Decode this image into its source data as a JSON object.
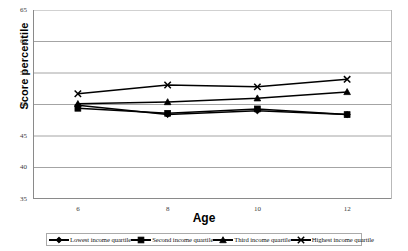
{
  "top_sliver_text": "",
  "axis": {
    "ylabel": "Score percentile",
    "xlabel": "Age",
    "yticks": [
      "65",
      "60",
      "55",
      "50",
      "45",
      "40",
      "35"
    ],
    "xticks": [
      "6",
      "8",
      "10",
      "12"
    ]
  },
  "legend": {
    "items": [
      {
        "label": "Lowest income quartile",
        "marker": "diamond-marker",
        "color": "#000000"
      },
      {
        "label": "Second income quartile",
        "marker": "square-marker",
        "color": "#000000"
      },
      {
        "label": "Third income quartile",
        "marker": "triangle-marker",
        "color": "#000000"
      },
      {
        "label": "Highest income quartile",
        "marker": "x-marker",
        "color": "#000000"
      }
    ]
  },
  "chart_data": {
    "type": "line",
    "title": "",
    "xlabel": "Age",
    "ylabel": "Score percentile",
    "x": [
      6,
      8,
      10,
      12
    ],
    "categories": [
      "6",
      "8",
      "10",
      "12"
    ],
    "xlim": [
      5,
      13
    ],
    "ylim": [
      35,
      65
    ],
    "ytick_values": [
      35,
      40,
      45,
      50,
      55,
      60,
      65
    ],
    "grid": "horizontal",
    "legend_position": "bottom",
    "series": [
      {
        "name": "Lowest income quartile",
        "marker": "diamond",
        "color": "#000000",
        "values": [
          49.9,
          48.4,
          49.0,
          48.4
        ]
      },
      {
        "name": "Second income quartile",
        "marker": "square",
        "color": "#000000",
        "values": [
          49.4,
          48.6,
          49.3,
          48.4
        ]
      },
      {
        "name": "Third income quartile",
        "marker": "triangle",
        "color": "#000000",
        "values": [
          50.1,
          50.4,
          51.0,
          52.0
        ]
      },
      {
        "name": "Highest income quartile",
        "marker": "x",
        "color": "#000000",
        "values": [
          51.7,
          53.1,
          52.8,
          54.0
        ]
      }
    ]
  }
}
